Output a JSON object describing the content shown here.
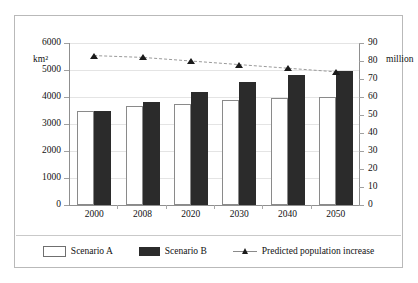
{
  "chart_data": {
    "type": "bar",
    "title": "",
    "categories": [
      "2000",
      "2008",
      "2020",
      "2030",
      "2040",
      "2050"
    ],
    "series": [
      {
        "name": "Scenario A",
        "values": [
          3500,
          3650,
          3750,
          3880,
          3950,
          4000
        ],
        "axis": "left",
        "color": "#ffffff"
      },
      {
        "name": "Scenario B",
        "values": [
          3500,
          3820,
          4200,
          4550,
          4800,
          4980
        ],
        "axis": "left",
        "color": "#2b2b2b"
      },
      {
        "name": "Predicted population increase",
        "values": [
          83,
          82,
          80,
          78,
          76,
          74
        ],
        "axis": "right",
        "type": "line",
        "color": "#1a1a1a"
      }
    ],
    "xlabel": "",
    "ylabel_left": "km²",
    "ylabel_right": "million",
    "ylim_left": [
      0,
      6000
    ],
    "ylim_right": [
      0,
      90
    ],
    "yticks_left": [
      "0",
      "1000",
      "2000",
      "3000",
      "4000",
      "5000",
      "6000"
    ],
    "yticks_right": [
      "0",
      "10",
      "20",
      "30",
      "40",
      "50",
      "60",
      "70",
      "80",
      "90"
    ],
    "grid": true,
    "legend_position": "bottom"
  },
  "axes": {
    "unit_left": "km²",
    "unit_right": "million",
    "left_ticks": [
      "6000",
      "5000",
      "4000",
      "3000",
      "2000",
      "1000",
      "0"
    ],
    "right_ticks": [
      "90",
      "80",
      "70",
      "60",
      "50",
      "40",
      "30",
      "20",
      "10",
      "0"
    ],
    "x_ticks": [
      "2000",
      "2008",
      "2020",
      "2030",
      "2040",
      "2050"
    ]
  },
  "legend": {
    "items": [
      {
        "label": "Scenario A",
        "swatch": "open-square-swatch"
      },
      {
        "label": "Scenario B",
        "swatch": "filled-square-swatch"
      },
      {
        "label": "Predicted population increase",
        "swatch": "triangle-line-swatch"
      }
    ]
  }
}
